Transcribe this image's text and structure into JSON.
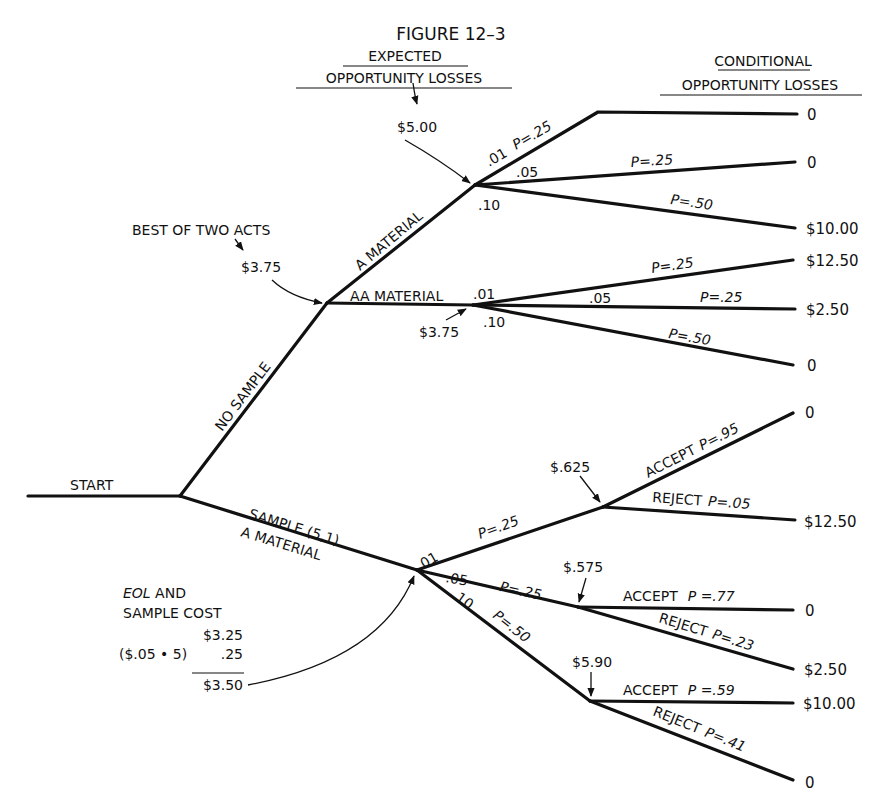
{
  "figure": {
    "title": "FIGURE 12–3",
    "left_header": {
      "line1": "EXPECTED",
      "line2": "OPPORTUNITY LOSSES"
    },
    "right_header": {
      "line1": "CONDITIONAL",
      "line2": "OPPORTUNITY LOSSES"
    }
  },
  "root": {
    "label": "START"
  },
  "no_sample": {
    "branch_label": "NO SAMPLE",
    "annotation": "BEST OF TWO ACTS",
    "value": "$3.75",
    "a_material": {
      "branch_label": "A MATERIAL",
      "eol": "$5.00",
      "outcomes": [
        {
          "defect": ".01",
          "prob": "P=.25",
          "loss": "0"
        },
        {
          "defect": ".05",
          "prob": "P=.25",
          "loss": "0"
        },
        {
          "defect": ".10",
          "prob": "P=.50",
          "loss": "$10.00"
        }
      ]
    },
    "aa_material": {
      "branch_label": "AA MATERIAL",
      "eol": "$3.75",
      "outcomes": [
        {
          "defect": ".01",
          "prob": "P=.25",
          "loss": "$12.50"
        },
        {
          "defect": ".05",
          "prob": "P=.25",
          "loss": "$2.50"
        },
        {
          "defect": ".10",
          "prob": "P=.50",
          "loss": "0"
        }
      ]
    }
  },
  "sample": {
    "branch_label_1": "SAMPLE (5,1)",
    "branch_label_2": "A MATERIAL",
    "annotation": {
      "line1_italic": "EOL",
      "line1_rest": " AND",
      "line2": "SAMPLE COST",
      "eol_value": "$3.25",
      "cost_formula": "($.05 • 5)",
      "cost_value": ".25",
      "total": "$3.50"
    },
    "branches": [
      {
        "defect": ".01",
        "prob": "P=.25",
        "eol": "$.625",
        "accept": {
          "label": "ACCEPT",
          "prob": "P=.95",
          "loss": "0"
        },
        "reject": {
          "label": "REJECT",
          "prob": "P=.05",
          "loss": "$12.50"
        }
      },
      {
        "defect": ".05",
        "prob": "P=.25",
        "eol": "$.575",
        "accept": {
          "label": "ACCEPT",
          "prob": "P =.77",
          "loss": "0"
        },
        "reject": {
          "label": "REJECT",
          "prob": "P=.23",
          "loss": "$2.50"
        }
      },
      {
        "defect": ".10",
        "prob": "P=.50",
        "eol": "$5.90",
        "accept": {
          "label": "ACCEPT",
          "prob": "P =.59",
          "loss": "$10.00"
        },
        "reject": {
          "label": "REJECT",
          "prob": "P=.41",
          "loss": "0"
        }
      }
    ]
  }
}
